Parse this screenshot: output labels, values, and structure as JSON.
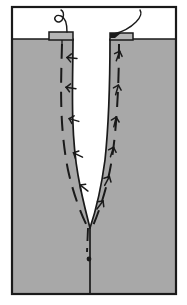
{
  "figure": {
    "type": "cross-section-diagram",
    "title": "",
    "caption": "",
    "width": 187,
    "height": 305,
    "colors": {
      "background": "#ffffff",
      "ground_fill": "#a8a8a8",
      "void_fill": "#ffffff",
      "line": "#1a1a1a",
      "frame": "#1a1a1a",
      "instrument_fill": "#b5b5b5"
    },
    "frame": {
      "label": "figure-border",
      "x": 11,
      "y": 6,
      "width": 166,
      "height": 289,
      "stroke_width": 2.2
    },
    "ground": {
      "label": "Ground / soil mass",
      "surface_y": 39,
      "left_x": 12,
      "right_x": 176,
      "bottom_y": 294
    },
    "void": {
      "label": "V-shaped open crack / trench void",
      "apex_y": 228,
      "top_left_x": 73,
      "top_right_x": 110
    },
    "instruments": [
      {
        "name": "left-surface-instrument",
        "label": "",
        "x": 49,
        "y": 32,
        "width": 24,
        "height": 8
      },
      {
        "name": "right-surface-instrument",
        "label": "",
        "x": 110,
        "y": 33,
        "width": 23,
        "height": 7
      }
    ],
    "cables": [
      {
        "name": "left-cable",
        "label": ""
      },
      {
        "name": "right-cable",
        "label": ""
      }
    ],
    "slip_surfaces": [
      {
        "name": "left-slip-surface",
        "label": "",
        "style": "dashed",
        "marker_count": 5
      },
      {
        "name": "right-slip-surface",
        "label": "",
        "style": "dashed",
        "marker_count": 6
      }
    ],
    "lower_features": {
      "center_solid_line": {
        "name": "center-vertical-line",
        "label": ""
      },
      "center_dashed_line": {
        "name": "center-dashed-line",
        "label": ""
      },
      "point_marker": {
        "name": "tip-point-marker",
        "label": "",
        "cx": 89,
        "cy": 259,
        "r": 2.4
      }
    }
  }
}
